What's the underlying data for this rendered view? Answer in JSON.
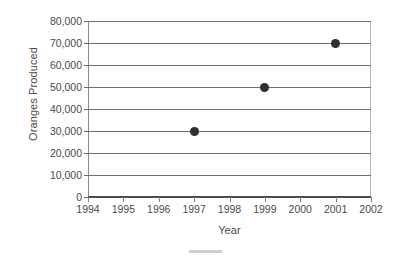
{
  "chart_data": {
    "type": "scatter",
    "title": "",
    "xlabel": "Year",
    "ylabel": "Oranges Produced",
    "x": [
      1997,
      1999,
      2001
    ],
    "values": [
      30000,
      50000,
      70000
    ],
    "points": [
      {
        "x": 1997,
        "y": 30000
      },
      {
        "x": 1999,
        "y": 50000
      },
      {
        "x": 2001,
        "y": 70000
      }
    ],
    "xlim": [
      1994,
      2002
    ],
    "ylim": [
      0,
      80000
    ],
    "x_ticks": [
      "1994",
      "1995",
      "1996",
      "1997",
      "1998",
      "1999",
      "2000",
      "2001",
      "2002"
    ],
    "x_tick_values": [
      1994,
      1995,
      1996,
      1997,
      1998,
      1999,
      2000,
      2001,
      2002
    ],
    "y_ticks": [
      "80,000",
      "70,000",
      "60,000",
      "50,000",
      "40,000",
      "30,000",
      "20,000",
      "10,000",
      "0"
    ],
    "y_tick_values": [
      80000,
      70000,
      60000,
      50000,
      40000,
      30000,
      20000,
      10000,
      0
    ],
    "grid": true,
    "grid_axis": "y",
    "legend": false,
    "legend_position": "none",
    "marker_color": "#2f2f2f",
    "gridline_color": "#6e6e6e",
    "axis_color": "#4d4d4d",
    "background_color": "#ffffff"
  }
}
